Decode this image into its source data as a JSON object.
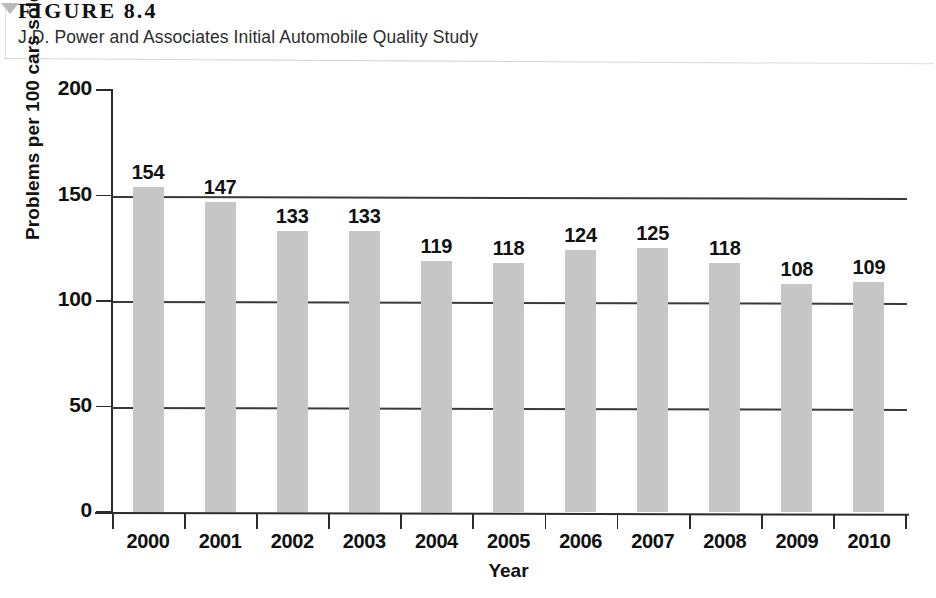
{
  "figure": {
    "number": "FIGURE 8.4",
    "subtitle": "J.D. Power and Associates Initial Automobile Quality Study"
  },
  "chart_data": {
    "type": "bar",
    "title": "J.D. Power and Associates Initial Automobile Quality Study",
    "categories": [
      "2000",
      "2001",
      "2002",
      "2003",
      "2004",
      "2005",
      "2006",
      "2007",
      "2008",
      "2009",
      "2010"
    ],
    "values": [
      154,
      147,
      133,
      133,
      119,
      118,
      124,
      125,
      118,
      108,
      109
    ],
    "xlabel": "Year",
    "ylabel": "Problems per 100 cars sold",
    "ylim": [
      0,
      200
    ],
    "yticks": [
      0,
      50,
      100,
      150,
      200
    ],
    "ytick_labels": [
      "0",
      "50",
      "100",
      "150",
      "200"
    ],
    "grid": true,
    "grid_axis": "y",
    "legend": null,
    "bar_color": "#c6c6c6",
    "axis_color": "#2b2b2b",
    "show_value_labels": true
  }
}
